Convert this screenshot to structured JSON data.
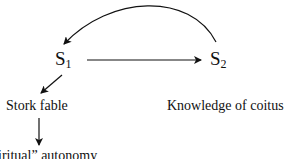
{
  "diagram": {
    "nodes": [
      {
        "id": "s1",
        "label": "S",
        "subscript": "1"
      },
      {
        "id": "s2",
        "label": "S",
        "subscript": "2"
      }
    ],
    "captions": {
      "s1": "Stork fable",
      "s2": "Knowledge of coitus",
      "bottom": "iritual” autonomy"
    },
    "edges": [
      {
        "from": "s1",
        "to": "s2",
        "type": "straight-arrow"
      },
      {
        "from": "s2",
        "to": "s1",
        "type": "curved-arrow"
      },
      {
        "from": "s1",
        "to": "stork-fable",
        "type": "diagonal-arrow"
      },
      {
        "from": "stork-fable",
        "to": "bottom",
        "type": "down-arrow"
      }
    ],
    "colors": {
      "ink": "#111111",
      "background": "#ffffff"
    }
  }
}
